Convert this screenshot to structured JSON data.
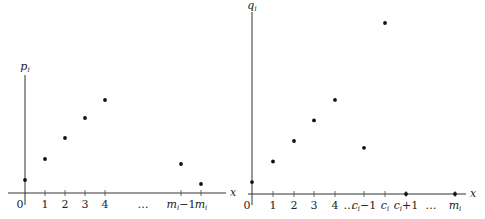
{
  "chart_data": [
    {
      "type": "scatter",
      "title": "",
      "ylabel": "p_i",
      "xlabel": "x",
      "x_ticks": [
        "0",
        "1",
        "2",
        "3",
        "4",
        "…",
        "m_i−1",
        "m_i"
      ],
      "points": [
        {
          "x": "0",
          "y": 0.13
        },
        {
          "x": "1",
          "y": 0.34
        },
        {
          "x": "2",
          "y": 0.55
        },
        {
          "x": "3",
          "y": 0.75
        },
        {
          "x": "4",
          "y": 0.93
        },
        {
          "x": "m_i−1",
          "y": 0.29
        },
        {
          "x": "m_i",
          "y": 0.09
        }
      ],
      "grid": false
    },
    {
      "type": "scatter",
      "title": "",
      "ylabel": "q_i",
      "xlabel": "x",
      "x_ticks": [
        "0",
        "1",
        "2",
        "3",
        "4",
        "…",
        "c_i−1",
        "c_i",
        "c_i+1",
        "…",
        "m_i"
      ],
      "points": [
        {
          "x": "0",
          "y": 0.07
        },
        {
          "x": "1",
          "y": 0.19
        },
        {
          "x": "2",
          "y": 0.31
        },
        {
          "x": "3",
          "y": 0.43
        },
        {
          "x": "4",
          "y": 0.55
        },
        {
          "x": "c_i−1",
          "y": 0.27
        },
        {
          "x": "c_i",
          "y": 1.0
        },
        {
          "x": "c_i+1",
          "y": 0.0
        },
        {
          "x": "m_i",
          "y": 0.0
        }
      ],
      "grid": false
    }
  ],
  "labels": {
    "left": {
      "y_axis": {
        "base": "p",
        "sub": "i"
      },
      "x_axis": "x",
      "ticks": [
        {
          "text": "0"
        },
        {
          "text": "1"
        },
        {
          "text": "2"
        },
        {
          "text": "3"
        },
        {
          "text": "4"
        },
        {
          "text": "…"
        },
        {
          "base": "m",
          "sub": "i",
          "suffix": "−1"
        },
        {
          "base": "m",
          "sub": "i",
          "suffix": ""
        }
      ]
    },
    "right": {
      "y_axis": {
        "base": "q",
        "sub": "i"
      },
      "x_axis": "x",
      "ticks": [
        {
          "text": "0"
        },
        {
          "text": "1"
        },
        {
          "text": "2"
        },
        {
          "text": "3"
        },
        {
          "text": "4"
        },
        {
          "text": "…"
        },
        {
          "base": "c",
          "sub": "i",
          "suffix": "−1"
        },
        {
          "base": "c",
          "sub": "i",
          "suffix": ""
        },
        {
          "base": "c",
          "sub": "i",
          "suffix": "+1"
        },
        {
          "text": "…"
        },
        {
          "base": "m",
          "sub": "i",
          "suffix": ""
        }
      ]
    }
  }
}
